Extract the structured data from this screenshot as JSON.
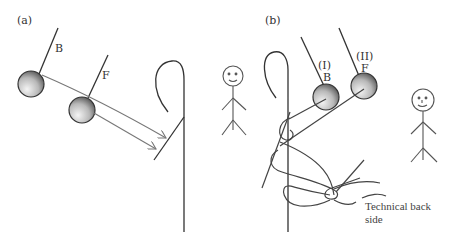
{
  "diagram": {
    "panel_a": {
      "label": "(a)",
      "needle_B_label": "B",
      "needle_F_label": "F"
    },
    "panel_b": {
      "label": "(b)",
      "needle_I_label": "(I)",
      "needle_I_sub": "B",
      "needle_II_label": "(II)",
      "needle_II_sub": "F",
      "caption_line1": "Technical back",
      "caption_line2": "side"
    },
    "colors": {
      "stroke": "#444444",
      "needle_light": "#f2f2f2",
      "needle_dark": "#555555"
    }
  }
}
